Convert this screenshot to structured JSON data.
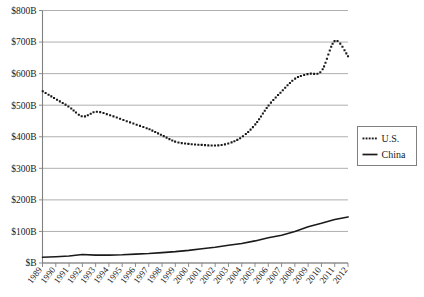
{
  "chart_data": {
    "type": "line",
    "title": "",
    "xlabel": "",
    "ylabel": "",
    "grid": true,
    "legend_position": "right",
    "ylim": [
      0,
      800
    ],
    "y_unit": "B",
    "y_ticks": [
      0,
      100,
      200,
      300,
      400,
      500,
      600,
      700,
      800
    ],
    "y_tick_labels": [
      "$B",
      "$100B",
      "$200B",
      "$300B",
      "$400B",
      "$500B",
      "$600B",
      "$700B",
      "$800B"
    ],
    "categories": [
      "1989",
      "1990",
      "1991",
      "1992",
      "1993",
      "1994",
      "1995",
      "1996",
      "1997",
      "1998",
      "1999",
      "2000",
      "2001",
      "2002",
      "2003",
      "2004",
      "2005",
      "2006",
      "2007",
      "2008",
      "2009",
      "2010",
      "2011",
      "2012"
    ],
    "series": [
      {
        "name": "U.S.",
        "style": "dotted",
        "values": [
          545,
          520,
          495,
          465,
          480,
          470,
          455,
          440,
          425,
          405,
          385,
          378,
          375,
          373,
          380,
          400,
          440,
          500,
          545,
          585,
          600,
          610,
          650,
          705
        ]
      },
      {
        "name": "China",
        "style": "solid",
        "values": [
          18,
          20,
          22,
          27,
          25,
          25,
          26,
          28,
          30,
          33,
          36,
          40,
          45,
          50,
          56,
          62,
          70,
          80,
          88,
          100,
          115,
          126,
          138,
          146
        ]
      }
    ],
    "series_extra_note": {
      "us_peak_value": 705,
      "us_peak_year": "2011",
      "us_final_value": 655,
      "us_final_year": "2012"
    },
    "colors": {
      "us": "#1a1a1a",
      "china": "#1a1a1a",
      "grid": "#a6a6a6",
      "axis": "#808080",
      "background": "#ffffff"
    }
  },
  "legend": {
    "items": [
      {
        "label": "U.S.",
        "marker": "dotted-line-marker"
      },
      {
        "label": "China",
        "marker": "solid-line-marker"
      }
    ]
  }
}
